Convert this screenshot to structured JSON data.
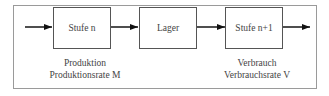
{
  "diagram": {
    "boxes": [
      {
        "label": "Stufe n"
      },
      {
        "label": "Lager"
      },
      {
        "label": "Stufe n+1"
      }
    ],
    "production": {
      "title": "Produktion",
      "rate": "Produktionsrate M"
    },
    "consumption": {
      "title": "Verbrauch",
      "rate": "Verbrauchsrate V"
    }
  }
}
